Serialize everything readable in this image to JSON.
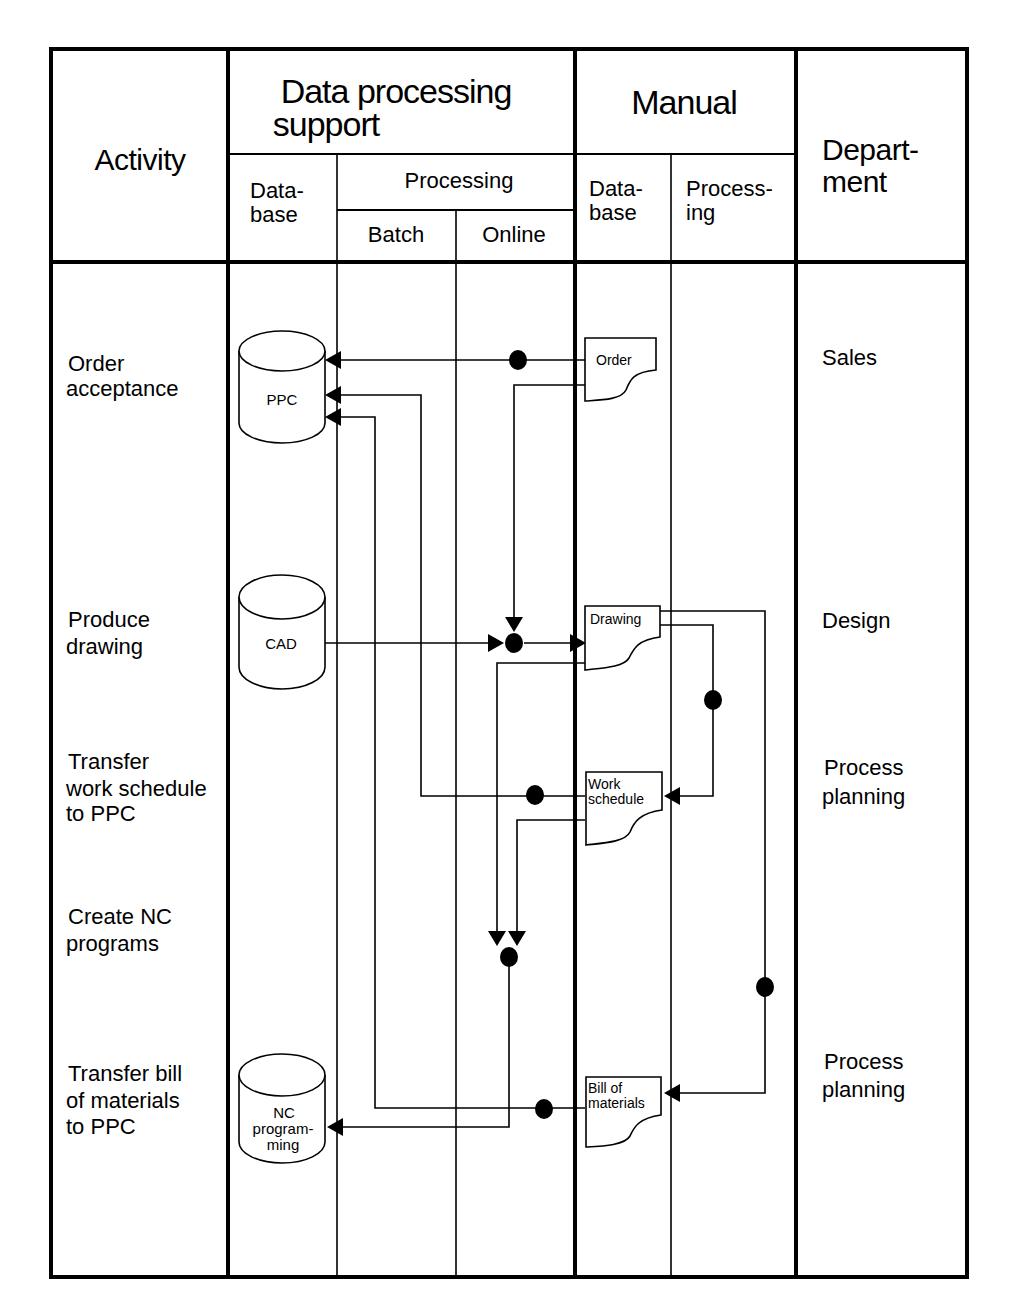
{
  "header": {
    "activity": "Activity",
    "dp_support_line1": "Data processing",
    "dp_support_line2": "support",
    "dp_database_line1": "Data-",
    "dp_database_line2": "base",
    "processing": "Processing",
    "batch": "Batch",
    "online": "Online",
    "manual": "Manual",
    "manual_database_line1": "Data-",
    "manual_database_line2": "base",
    "manual_processing_line1": "Process-",
    "manual_processing_line2": "ing",
    "department_line1": "Depart-",
    "department_line2": "ment"
  },
  "activities": [
    {
      "line1": "Order",
      "line2": "acceptance",
      "line3": ""
    },
    {
      "line1": "Produce",
      "line2": "drawing",
      "line3": ""
    },
    {
      "line1": "Transfer",
      "line2": "work schedule",
      "line3": "to PPC"
    },
    {
      "line1": "Create NC",
      "line2": "programs",
      "line3": ""
    },
    {
      "line1": "Transfer bill",
      "line2": "of materials",
      "line3": "to PPC"
    }
  ],
  "departments": [
    {
      "line1": "Sales",
      "line2": ""
    },
    {
      "line1": "Design",
      "line2": ""
    },
    {
      "line1": "Process",
      "line2": "planning"
    },
    {
      "line1": "Process",
      "line2": "planning"
    }
  ],
  "databases": [
    {
      "id": "ppc",
      "line1": "PPC",
      "line2": "",
      "line3": ""
    },
    {
      "id": "cad",
      "line1": "CAD",
      "line2": "",
      "line3": ""
    },
    {
      "id": "nc",
      "line1": "NC",
      "line2": "program-",
      "line3": "ming"
    }
  ],
  "documents": [
    {
      "id": "order",
      "line1": "Order",
      "line2": ""
    },
    {
      "id": "drawing",
      "line1": "Drawing",
      "line2": ""
    },
    {
      "id": "work-schedule",
      "line1": "Work",
      "line2": "schedule"
    },
    {
      "id": "bill-of-materials",
      "line1": "Bill of",
      "line2": "materials"
    }
  ]
}
